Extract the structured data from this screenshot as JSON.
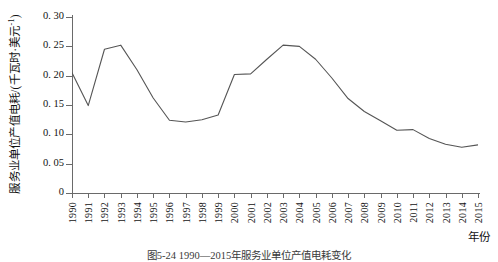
{
  "figure": {
    "caption": "图5-24 1990—2015年服务业单位产值电耗变化",
    "xlabel": "年份",
    "ylabel_main": "服务业单位产值电耗/(千瓦时·美元",
    "ylabel_sup": "-1",
    "ylabel_close": ")",
    "line_color": "#555555",
    "axis_color": "#6a6a6a"
  },
  "chart_data": {
    "type": "line",
    "title": "图5-24 1990—2015年服务业单位产值电耗变化",
    "xlabel": "年份",
    "ylabel": "服务业单位产值电耗/(千瓦时·美元⁻¹)",
    "xlim": [
      1990,
      2015
    ],
    "ylim": [
      0,
      0.3
    ],
    "yticks": [
      0,
      0.05,
      0.1,
      0.15,
      0.2,
      0.25,
      0.3
    ],
    "ytick_labels": [
      "0",
      "0. 05",
      "0. 10",
      "0. 15",
      "0. 20",
      "0. 25",
      "0. 30"
    ],
    "grid": false,
    "legend": false,
    "categories": [
      1990,
      1991,
      1992,
      1993,
      1994,
      1995,
      1996,
      1997,
      1998,
      1999,
      2000,
      2001,
      2002,
      2003,
      2004,
      2005,
      2006,
      2007,
      2008,
      2009,
      2010,
      2011,
      2012,
      2013,
      2014,
      2015
    ],
    "xtick_labels": [
      "1990",
      "1991",
      "1992",
      "1993",
      "1994",
      "1995",
      "1996",
      "1997",
      "1998",
      "1999",
      "2000",
      "2001",
      "2002",
      "2003",
      "2004",
      "2005",
      "2006",
      "2007",
      "2008",
      "2009",
      "2010",
      "2011",
      "2012",
      "2013",
      "2014",
      "2015"
    ],
    "series": [
      {
        "name": "服务业单位产值电耗",
        "values": [
          0.205,
          0.149,
          0.245,
          0.252,
          0.21,
          0.162,
          0.124,
          0.121,
          0.125,
          0.133,
          0.202,
          0.203,
          0.228,
          0.252,
          0.25,
          0.228,
          0.196,
          0.161,
          0.139,
          0.123,
          0.107,
          0.108,
          0.093,
          0.083,
          0.078,
          0.082
        ]
      }
    ]
  }
}
